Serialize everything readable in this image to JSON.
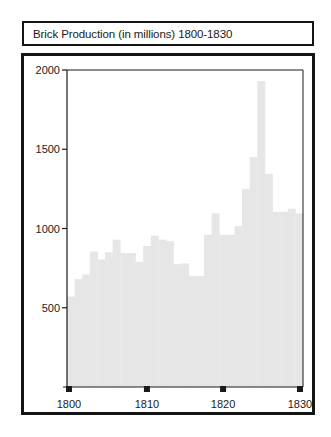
{
  "chart_data": {
    "type": "bar",
    "title": "Brick Production (in millions) 1800-1830",
    "xlabel": "",
    "ylabel": "",
    "categories": [
      "1800",
      "1801",
      "1802",
      "1803",
      "1804",
      "1805",
      "1806",
      "1807",
      "1808",
      "1809",
      "1810",
      "1811",
      "1812",
      "1813",
      "1814",
      "1815",
      "1816",
      "1817",
      "1818",
      "1819",
      "1820",
      "1821",
      "1822",
      "1823",
      "1824",
      "1825",
      "1826",
      "1827",
      "1828",
      "1829",
      "1830"
    ],
    "values": [
      570,
      680,
      710,
      855,
      805,
      850,
      930,
      845,
      845,
      790,
      890,
      955,
      930,
      920,
      775,
      780,
      700,
      700,
      960,
      1095,
      960,
      960,
      1015,
      1250,
      1450,
      1930,
      1345,
      1105,
      1105,
      1125,
      1095
    ],
    "ylim": [
      0,
      2000
    ],
    "xlim": [
      1800,
      1830
    ],
    "yticks": [
      500,
      1000,
      1500,
      2000
    ],
    "ytick_labels": [
      "500",
      "1000",
      "1500",
      "2000"
    ],
    "xticks": [
      1800,
      1810,
      1820,
      1830
    ],
    "xtick_labels": [
      "1800",
      "1810",
      "1820",
      "1830"
    ],
    "grid": false,
    "legend": "none",
    "bar_color": "#e6e6e6",
    "axis_color": "#1a1a1a"
  }
}
